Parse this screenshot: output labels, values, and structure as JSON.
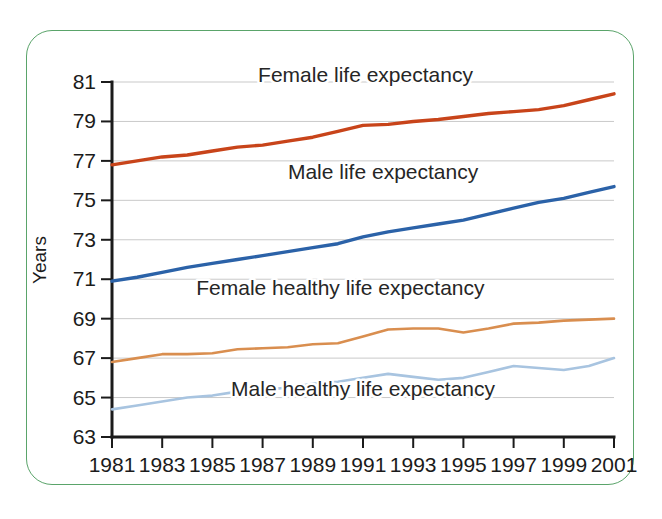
{
  "figure": {
    "frame_color": "#5aa46a",
    "background": "#ffffff"
  },
  "chart_data": {
    "type": "line",
    "title": "",
    "xlabel": "",
    "ylabel": "Years",
    "xlim": [
      1981,
      2001
    ],
    "ylim": [
      63,
      81
    ],
    "ytick_step": 2,
    "xtick_step": 2,
    "grid": true,
    "legend": "inline-annotations",
    "x": [
      1981,
      1982,
      1983,
      1984,
      1985,
      1986,
      1987,
      1988,
      1989,
      1990,
      1991,
      1992,
      1993,
      1994,
      1995,
      1996,
      1997,
      1998,
      1999,
      2000,
      2001
    ],
    "ytick_labels": [
      "63",
      "65",
      "67",
      "69",
      "71",
      "73",
      "75",
      "77",
      "79",
      "81"
    ],
    "xtick_labels": [
      "1981",
      "1983",
      "1985",
      "1987",
      "1989",
      "1991",
      "1993",
      "1995",
      "1997",
      "1999",
      "2001"
    ],
    "series": [
      {
        "name": "Female life expectancy",
        "color": "#c8441a",
        "width": 3.4,
        "label_x": 1991.1,
        "label_y": 81.0,
        "label_anchor": "middle",
        "values": [
          76.8,
          77.0,
          77.2,
          77.3,
          77.5,
          77.7,
          77.8,
          78.0,
          78.2,
          78.5,
          78.8,
          78.85,
          79.0,
          79.1,
          79.25,
          79.4,
          79.5,
          79.6,
          79.8,
          80.1,
          80.4
        ]
      },
      {
        "name": "Male life expectancy",
        "color": "#2b62a8",
        "width": 3.4,
        "label_x": 1991.8,
        "label_y": 76.1,
        "label_anchor": "middle",
        "values": [
          70.9,
          71.1,
          71.35,
          71.6,
          71.8,
          72.0,
          72.2,
          72.4,
          72.6,
          72.8,
          73.15,
          73.4,
          73.6,
          73.8,
          74.0,
          74.3,
          74.6,
          74.9,
          75.1,
          75.4,
          75.7
        ]
      },
      {
        "name": "Female healthy life expectancy",
        "color": "#d98e4f",
        "width": 2.6,
        "label_x": 1990.1,
        "label_y": 70.2,
        "label_anchor": "middle",
        "values": [
          66.8,
          67.0,
          67.2,
          67.2,
          67.25,
          67.45,
          67.5,
          67.55,
          67.7,
          67.75,
          68.1,
          68.45,
          68.5,
          68.5,
          68.3,
          68.5,
          68.75,
          68.8,
          68.9,
          68.95,
          69.0
        ]
      },
      {
        "name": "Male healthy life expectancy",
        "color": "#a8c4e0",
        "width": 2.6,
        "label_x": 1991.0,
        "label_y": 65.1,
        "label_anchor": "middle",
        "values": [
          64.4,
          64.6,
          64.8,
          65.0,
          65.1,
          65.3,
          65.4,
          65.5,
          65.7,
          65.8,
          66.0,
          66.2,
          66.05,
          65.9,
          66.0,
          66.3,
          66.6,
          66.5,
          66.4,
          66.6,
          67.0
        ]
      }
    ]
  }
}
